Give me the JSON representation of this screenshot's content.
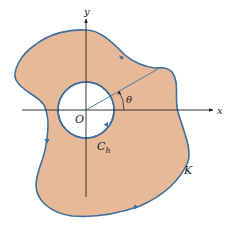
{
  "diagram": {
    "colors": {
      "region_fill": "#e8b998",
      "curve_stroke": "#3d6f9e",
      "axis": "#222222",
      "hole_fill": "#ffffff"
    },
    "labels": {
      "y_axis": "y",
      "x_axis": "x",
      "origin": "O",
      "angle": "θ",
      "inner_curve": "C",
      "inner_curve_subscript": "h",
      "outer_curve": "K"
    }
  }
}
